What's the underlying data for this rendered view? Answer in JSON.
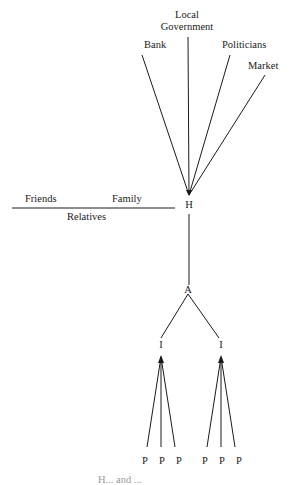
{
  "diagram": {
    "hub": "H",
    "external_links": [
      "Bank",
      "Local Government",
      "Politicians",
      "Market"
    ],
    "local_gov_lines": [
      "Local",
      "Government"
    ],
    "kin_line": {
      "top_left": "Friends",
      "top_right": "Family",
      "bottom": "Relatives"
    },
    "intermediate": "A",
    "sub_nodes": [
      "I",
      "I"
    ],
    "leaf_label": "P",
    "leaves_per_sub_node": 3,
    "caption_partial": "H... and ..."
  },
  "colors": {
    "line": "#1a1a1a",
    "background": "#ffffff"
  }
}
